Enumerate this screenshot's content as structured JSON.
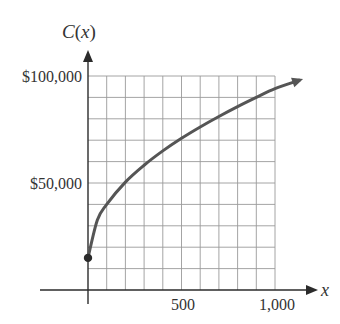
{
  "chart_data": {
    "type": "line",
    "title": "",
    "xlabel": "x",
    "ylabel": "C(x)",
    "xlim": [
      0,
      1000
    ],
    "ylim": [
      0,
      100000
    ],
    "x_ticks": [
      {
        "value": 500,
        "label": "500"
      },
      {
        "value": 1000,
        "label": "1,000"
      }
    ],
    "y_ticks": [
      {
        "value": 50000,
        "label": "$50,000"
      },
      {
        "value": 100000,
        "label": "$100,000"
      }
    ],
    "grid": {
      "on": true,
      "x_step": 100,
      "y_step": 10000
    },
    "series": [
      {
        "name": "C(x)",
        "x": [
          0,
          50,
          100,
          200,
          300,
          400,
          500,
          600,
          700,
          800,
          900,
          1000,
          1130
        ],
        "values": [
          15000,
          32700,
          40000,
          50400,
          58300,
          65000,
          70900,
          76200,
          81100,
          85700,
          90000,
          94100,
          98000
        ],
        "start_point_marker": {
          "x": 0,
          "y": 15000
        },
        "end_arrow": true
      }
    ],
    "color": "#555555"
  },
  "labels": {
    "y_axis_title": "C(x)",
    "x_axis_title": "x",
    "y_tick_top": "$100,000",
    "y_tick_mid": "$50,000",
    "x_tick_mid": "500",
    "x_tick_end": "1,000"
  }
}
